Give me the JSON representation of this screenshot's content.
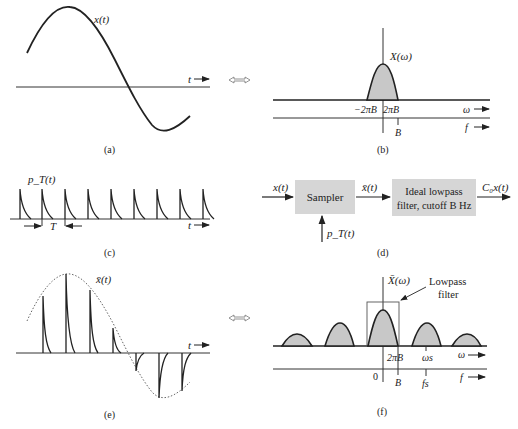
{
  "panels": {
    "a": {
      "caption": "(a)",
      "signal_label": "x(t)",
      "axis_label": "t"
    },
    "b": {
      "caption": "(b)",
      "spectrum_label": "X(ω)",
      "tick_neg": "−2πB",
      "tick_pos": "2πB",
      "omega_axis": "ω",
      "f_axis": "f",
      "f_tick": "B"
    },
    "c": {
      "caption": "(c)",
      "signal_label": "p_T(t)",
      "period_label": "T",
      "axis_label": "t",
      "pulse_count": 9
    },
    "d": {
      "caption": "(d)",
      "input_label": "x(t)",
      "sampler_label": "Sampler",
      "sampled_label": "x̄(t)",
      "filter_line1": "Ideal lowpass",
      "filter_line2": "filter, cutoff B Hz",
      "output_label": "C₀x(t)",
      "pulse_input_label": "p_T(t)"
    },
    "e": {
      "caption": "(e)",
      "signal_label": "x̄(t)",
      "axis_label": "t"
    },
    "f": {
      "caption": "(f)",
      "spectrum_label": "X̄(ω)",
      "filter_annotation_line1": "Lowpass",
      "filter_annotation_line2": "filter",
      "tick_2piB": "2πB",
      "tick_omega_s": "ωs",
      "omega_axis": "ω",
      "zero": "0",
      "f_tick_B": "B",
      "f_tick_fs": "fs",
      "f_axis": "f"
    }
  },
  "transform_arrow": "⇔",
  "figure_caption": "Figure ... (cut off)",
  "colors": {
    "ink": "#222222",
    "fill_gray": "#c8c8c8",
    "box_gray": "#d6d6d6"
  }
}
